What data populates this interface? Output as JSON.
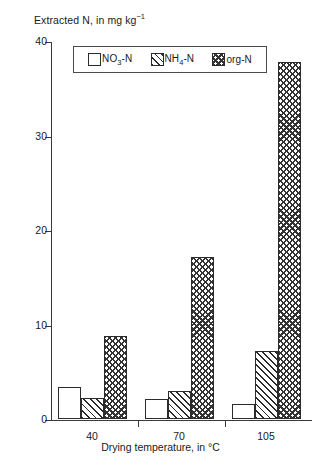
{
  "chart_data": {
    "type": "bar",
    "title": "",
    "ylabel": "Extracted N, in mg kg⁻¹",
    "ylabel_parts": {
      "main": "Extracted N, in mg kg",
      "sup": "−1"
    },
    "xlabel": "Drying temperature, in °C",
    "categories": [
      "40",
      "70",
      "105"
    ],
    "ylim": [
      0,
      40
    ],
    "yticks": [
      "0",
      "10",
      "20",
      "30",
      "40"
    ],
    "ytick_values": [
      0,
      10,
      20,
      30,
      40
    ],
    "grid": false,
    "legend_position": "upper center",
    "series": [
      {
        "name": "NO3-N",
        "label_main": "NO",
        "label_sub": "3",
        "label_tail": "-N",
        "fill": "none",
        "values": [
          3.4,
          2.1,
          1.6
        ]
      },
      {
        "name": "NH4-N",
        "label_main": "NH",
        "label_sub": "4",
        "label_tail": "-N",
        "fill": "diagonal-hatch",
        "values": [
          2.2,
          3.0,
          7.2
        ]
      },
      {
        "name": "org-N",
        "label_main": "org-N",
        "label_sub": "",
        "label_tail": "",
        "fill": "checkerboard",
        "values": [
          8.8,
          17.1,
          37.8
        ]
      }
    ],
    "colors": {
      "axis": "#3a3a3a",
      "bar_edge": "#2b2b2b",
      "hatch": "#333333",
      "background": "#ffffff"
    }
  }
}
